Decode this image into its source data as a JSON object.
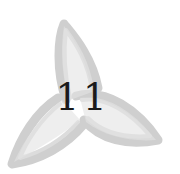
{
  "emblem": {
    "shape": "trefoil-petal-ornament",
    "petal_color": "#d4d4d4",
    "petal_stroke_color": "#c4c4c4",
    "number_color": "#1a1a1a"
  },
  "chapter": {
    "number": "11"
  }
}
